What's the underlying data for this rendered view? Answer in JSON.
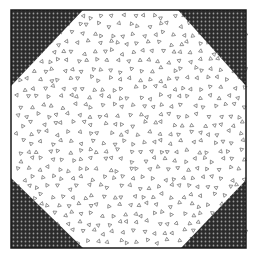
{
  "figure": {
    "background_fabric": {
      "name": "white-with-triangle-print",
      "base_color": "#ffffff",
      "motif": "small outlined triangles",
      "motif_color": "#666666"
    },
    "corner_fabric": {
      "name": "dark-dotted-print",
      "base_color": "#2b2b2b",
      "dot_color": "#9a9a9a"
    },
    "border_color": "#1a1a1a",
    "corners": [
      "top-left",
      "top-right",
      "bottom-left",
      "bottom-right"
    ]
  }
}
